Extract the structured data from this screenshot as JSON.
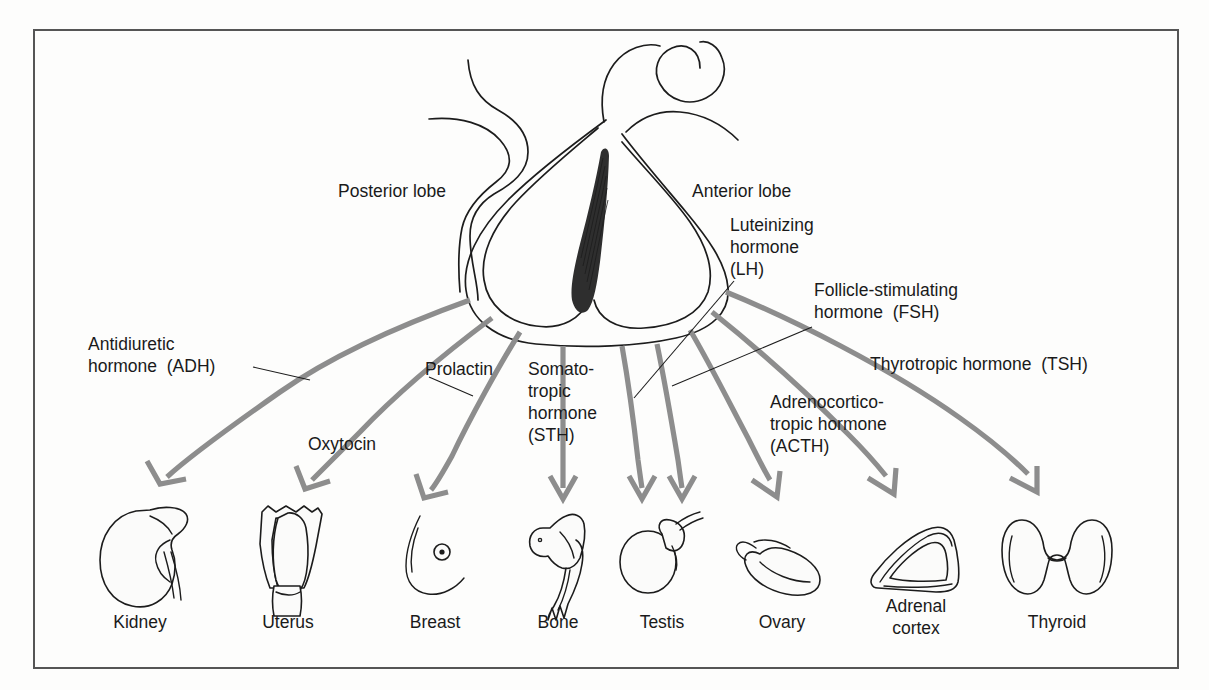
{
  "figure": {
    "background_color": "#fdfdfc",
    "frame_color": "#555555",
    "arrow_color": "#8d8d8d",
    "text_color": "#1a1a1a"
  },
  "gland_labels": {
    "posterior": "Posterior lobe",
    "anterior": "Anterior lobe"
  },
  "hormones": [
    {
      "id": "adh",
      "lines": [
        "Antidiuretic",
        "hormone  (ADH)"
      ],
      "target": "Kidney"
    },
    {
      "id": "oxytocin",
      "lines": [
        "Oxytocin"
      ],
      "target": "Uterus"
    },
    {
      "id": "prolactin",
      "lines": [
        "Prolactin"
      ],
      "target": "Breast"
    },
    {
      "id": "sth",
      "lines": [
        "Somato-",
        "tropic",
        "hormone",
        "(STH)"
      ],
      "target": "Bone"
    },
    {
      "id": "lh",
      "lines": [
        "Luteinizing",
        "hormone",
        "(LH)"
      ],
      "target": "Ovary"
    },
    {
      "id": "fsh",
      "lines": [
        "Follicle-stimulating",
        "hormone  (FSH)"
      ],
      "target": "Testis"
    },
    {
      "id": "acth",
      "lines": [
        "Adrenocortico-",
        "tropic hormone",
        "(ACTH)"
      ],
      "target": "Adrenal cortex"
    },
    {
      "id": "tsh",
      "lines": [
        "Thyrotropic hormone  (TSH)"
      ],
      "target": "Thyroid"
    }
  ],
  "organs": [
    {
      "id": "kidney",
      "label": "Kidney"
    },
    {
      "id": "uterus",
      "label": "Uterus"
    },
    {
      "id": "breast",
      "label": "Breast"
    },
    {
      "id": "bone",
      "label": "Bone"
    },
    {
      "id": "testis",
      "label": "Testis"
    },
    {
      "id": "ovary",
      "label": "Ovary"
    },
    {
      "id": "adrenal",
      "label_line1": "Adrenal",
      "label_line2": "cortex"
    },
    {
      "id": "thyroid",
      "label": "Thyroid"
    }
  ]
}
